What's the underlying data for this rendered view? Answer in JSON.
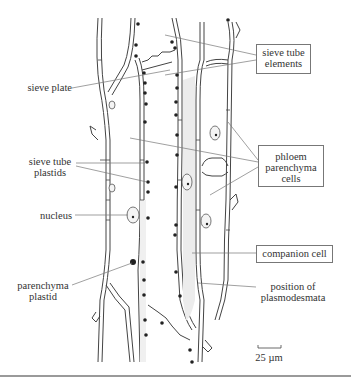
{
  "labels": {
    "sieve_tube_elements": [
      "sieve tube",
      "elements"
    ],
    "sieve_plate": "sieve plate",
    "phloem_parenchyma_cells": [
      "phloem",
      "parenchyma",
      "cells"
    ],
    "sieve_tube_plastids": [
      "sieve tube",
      "plastids"
    ],
    "nucleus": "nucleus",
    "companion_cell": "companion cell",
    "parenchyma_plastid": [
      "parenchyma",
      "plastid"
    ],
    "position_of_plasmodesmata": [
      "position of",
      "plasmodesmata"
    ]
  },
  "scale_bar": {
    "label": "25 µm"
  },
  "colors": {
    "line": "#444444",
    "leader": "#666666",
    "companion_fill": "#ececec",
    "plastid": "#222222",
    "box_border": "#777777"
  }
}
